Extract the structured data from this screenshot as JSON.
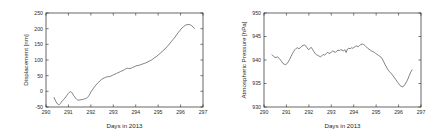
{
  "figure": {
    "background": "#ffffff",
    "line_color": "#4a4a4a",
    "axis_color": "#262626",
    "panel_count": 2
  },
  "chart_data": [
    {
      "type": "line",
      "title": "",
      "xlabel": "Days in 2013",
      "ylabel": "Displacement [nm]",
      "xlim": [
        290,
        297
      ],
      "ylim": [
        -50,
        250
      ],
      "xticks": [
        290,
        291,
        292,
        293,
        294,
        295,
        296,
        297
      ],
      "xticklabels": [
        "290",
        "291",
        "292",
        "293",
        "294",
        "295",
        "296",
        "297"
      ],
      "yticks": [
        -50,
        0,
        50,
        100,
        150,
        200,
        250
      ],
      "yticklabels": [
        "-50",
        "0",
        "50",
        "100",
        "150",
        "200",
        "250"
      ],
      "grid": false,
      "legend": false,
      "series": [
        {
          "name": "Displacement",
          "x": [
            290.36,
            290.4,
            290.44,
            290.48,
            290.52,
            290.56,
            290.6,
            290.64,
            290.68,
            290.72,
            290.76,
            290.8,
            290.84,
            290.88,
            290.92,
            290.96,
            291.0,
            291.04,
            291.08,
            291.12,
            291.16,
            291.2,
            291.24,
            291.28,
            291.32,
            291.36,
            291.4,
            291.44,
            291.48,
            291.52,
            291.56,
            291.6,
            291.64,
            291.68,
            291.72,
            291.76,
            291.8,
            291.84,
            291.88,
            291.92,
            291.96,
            292.0,
            292.06,
            292.12,
            292.18,
            292.24,
            292.3,
            292.36,
            292.42,
            292.48,
            292.54,
            292.6,
            292.66,
            292.72,
            292.78,
            292.84,
            292.9,
            292.96,
            293.02,
            293.08,
            293.14,
            293.2,
            293.26,
            293.32,
            293.38,
            293.44,
            293.5,
            293.56,
            293.62,
            293.68,
            293.74,
            293.8,
            293.86,
            293.92,
            293.98,
            294.06,
            294.14,
            294.22,
            294.3,
            294.38,
            294.46,
            294.54,
            294.62,
            294.7,
            294.78,
            294.86,
            294.94,
            295.02,
            295.1,
            295.18,
            295.26,
            295.34,
            295.42,
            295.5,
            295.58,
            295.66,
            295.74,
            295.82,
            295.9,
            295.98,
            296.06,
            296.14,
            296.22,
            296.3,
            296.38,
            296.44,
            296.5,
            296.56,
            296.62
          ],
          "y": [
            -20,
            -26,
            -32,
            -37,
            -41,
            -43,
            -42,
            -39,
            -35,
            -31,
            -28,
            -25,
            -22,
            -18,
            -14,
            -10,
            -6,
            -3,
            -1,
            -2,
            -5,
            -9,
            -14,
            -18,
            -22,
            -25,
            -27,
            -28,
            -28,
            -27,
            -27,
            -26,
            -26,
            -25,
            -24,
            -23,
            -22,
            -20,
            -17,
            -13,
            -8,
            -2,
            4,
            10,
            16,
            21,
            26,
            30,
            34,
            38,
            41,
            43,
            45,
            46,
            47,
            47,
            49,
            51,
            53,
            55,
            57,
            59,
            61,
            63,
            65,
            67,
            69,
            72,
            74,
            73,
            73,
            74,
            76,
            78,
            80,
            82,
            83,
            85,
            87,
            89,
            91,
            94,
            97,
            100,
            104,
            108,
            112,
            117,
            122,
            127,
            132,
            138,
            144,
            151,
            158,
            165,
            172,
            180,
            188,
            195,
            202,
            207,
            211,
            213,
            213,
            212,
            209,
            205,
            201
          ]
        }
      ]
    },
    {
      "type": "line",
      "title": "",
      "xlabel": "Days in 2013",
      "ylabel": "Atmospheric Pressure [hPa]",
      "xlim": [
        290,
        297
      ],
      "ylim": [
        930,
        950
      ],
      "xticks": [
        290,
        291,
        292,
        293,
        294,
        295,
        296,
        297
      ],
      "xticklabels": [
        "290",
        "291",
        "292",
        "293",
        "294",
        "295",
        "296",
        "297"
      ],
      "yticks": [
        930,
        935,
        940,
        945,
        950
      ],
      "yticklabels": [
        "930",
        "935",
        "940",
        "945",
        "950"
      ],
      "grid": false,
      "legend": false,
      "series": [
        {
          "name": "Atmospheric Pressure",
          "x": [
            290.36,
            290.42,
            290.48,
            290.54,
            290.6,
            290.66,
            290.72,
            290.78,
            290.84,
            290.9,
            290.96,
            291.02,
            291.08,
            291.14,
            291.2,
            291.26,
            291.32,
            291.38,
            291.44,
            291.5,
            291.56,
            291.62,
            291.68,
            291.74,
            291.8,
            291.86,
            291.92,
            291.98,
            292.04,
            292.1,
            292.16,
            292.22,
            292.28,
            292.34,
            292.4,
            292.46,
            292.52,
            292.58,
            292.64,
            292.7,
            292.76,
            292.82,
            292.88,
            292.94,
            293.0,
            293.06,
            293.12,
            293.18,
            293.24,
            293.3,
            293.36,
            293.42,
            293.48,
            293.54,
            293.6,
            293.66,
            293.72,
            293.78,
            293.84,
            293.9,
            293.96,
            294.02,
            294.08,
            294.14,
            294.2,
            294.26,
            294.32,
            294.38,
            294.44,
            294.5,
            294.56,
            294.62,
            294.68,
            294.74,
            294.8,
            294.86,
            294.92,
            294.98,
            295.04,
            295.1,
            295.16,
            295.22,
            295.28,
            295.34,
            295.4,
            295.46,
            295.52,
            295.58,
            295.64,
            295.7,
            295.76,
            295.82,
            295.88,
            295.94,
            296.0,
            296.06,
            296.12,
            296.18,
            296.24,
            296.3,
            296.36,
            296.42,
            296.48,
            296.54,
            296.6
          ],
          "y": [
            941.1,
            940.8,
            940.6,
            940.5,
            940.7,
            940.4,
            940.1,
            939.7,
            939.3,
            939.1,
            939.0,
            939.2,
            939.6,
            940.1,
            940.7,
            941.3,
            941.8,
            942.2,
            942.5,
            942.6,
            942.4,
            942.6,
            942.9,
            943.1,
            943.2,
            943.0,
            942.6,
            942.2,
            942.4,
            942.7,
            942.3,
            941.8,
            941.4,
            941.1,
            941.0,
            940.8,
            940.7,
            940.9,
            941.2,
            941.0,
            941.3,
            941.6,
            941.5,
            941.4,
            941.7,
            941.9,
            941.8,
            941.6,
            941.9,
            942.1,
            942.0,
            942.2,
            942.1,
            941.9,
            942.2,
            941.6,
            942.3,
            942.5,
            942.4,
            942.6,
            942.5,
            942.7,
            942.9,
            943.0,
            942.8,
            943.1,
            943.3,
            943.4,
            943.3,
            943.1,
            942.8,
            942.5,
            942.3,
            942.1,
            941.9,
            941.8,
            941.6,
            941.4,
            941.2,
            941.0,
            940.8,
            940.6,
            940.2,
            939.6,
            939.0,
            938.5,
            938.0,
            937.6,
            937.3,
            937.0,
            936.6,
            936.2,
            935.8,
            935.4,
            935.0,
            934.6,
            934.4,
            934.3,
            934.5,
            934.9,
            935.4,
            936.0,
            936.7,
            937.4,
            937.9
          ]
        }
      ]
    }
  ]
}
